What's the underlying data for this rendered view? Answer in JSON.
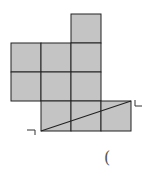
{
  "figure": {
    "cell_size": 30,
    "fill_color": "#c4c4c4",
    "stroke_color": "#222222",
    "squares": [
      {
        "col": 2,
        "row": 0
      },
      {
        "col": 0,
        "row": 1
      },
      {
        "col": 1,
        "row": 1
      },
      {
        "col": 2,
        "row": 1
      },
      {
        "col": 0,
        "row": 2
      },
      {
        "col": 1,
        "row": 2
      },
      {
        "col": 2,
        "row": 2
      },
      {
        "col": 1,
        "row": 3
      },
      {
        "col": 2,
        "row": 3
      },
      {
        "col": 3,
        "row": 3
      }
    ],
    "diagonal": {
      "from": "bottom-left of row 3 strip",
      "to": "top-right of row 3 strip"
    },
    "markers": [
      {
        "name": "left-corner-mark",
        "glyph": "¬"
      },
      {
        "name": "right-corner-mark",
        "glyph": "L"
      }
    ]
  },
  "answer_blank": {
    "text": "("
  }
}
